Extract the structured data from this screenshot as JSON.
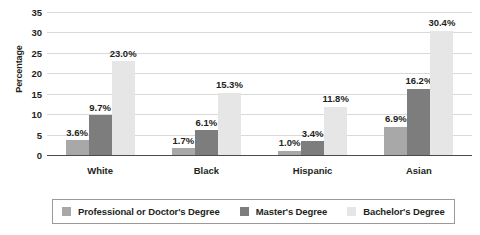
{
  "chart_data": {
    "type": "bar",
    "title": "",
    "subtitle": "",
    "xlabel": "",
    "ylabel": "Percentage",
    "ylim": [
      0,
      35
    ],
    "ytick_step": 5,
    "yticks": [
      "35",
      "30",
      "25",
      "20",
      "15",
      "10",
      "5",
      "0"
    ],
    "grid": true,
    "legend_position": "bottom",
    "categories": [
      "White",
      "Black",
      "Hispanic",
      "Asian"
    ],
    "series": [
      {
        "name": "Professional or Doctor's Degree",
        "color": "#a8a8a8",
        "values": [
          3.6,
          1.7,
          1.0,
          6.9
        ],
        "labels": [
          "3.6%",
          "1.7%",
          "1.0%",
          "6.9%"
        ]
      },
      {
        "name": "Master's Degree",
        "color": "#7d7d7d",
        "values": [
          9.7,
          6.1,
          3.4,
          16.2
        ],
        "labels": [
          "9.7%",
          "6.1%",
          "3.4%",
          "16.2%"
        ]
      },
      {
        "name": "Bachelor's Degree",
        "color": "#e6e6e6",
        "values": [
          23.0,
          15.3,
          11.8,
          30.4
        ],
        "labels": [
          "23.0%",
          "15.3%",
          "11.8%",
          "30.4%"
        ]
      }
    ],
    "colors": {
      "axis": "#4b4b4b",
      "gridline": "#d9d9d9",
      "text": "#231f20",
      "background": "#ffffff"
    }
  }
}
